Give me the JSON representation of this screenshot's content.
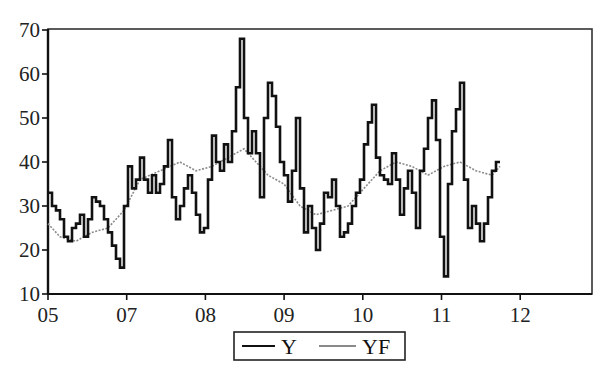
{
  "chart_data": {
    "type": "line",
    "title": "",
    "xlabel": "",
    "ylabel": "",
    "ylim": [
      10,
      70
    ],
    "yticks": [
      10,
      20,
      30,
      40,
      50,
      60,
      70
    ],
    "xticks": [
      "05",
      "07",
      "08",
      "09",
      "10",
      "11",
      "12"
    ],
    "grid": false,
    "legend_position": "bottom-center",
    "legend": [
      "Y",
      "YF"
    ],
    "series": [
      {
        "name": "Y",
        "color": "#111111",
        "style": "solid-thick",
        "x_px": [
          48,
          52,
          56,
          60,
          64,
          68,
          72,
          76,
          80,
          84,
          88,
          92,
          96,
          100,
          104,
          108,
          112,
          116,
          120,
          124,
          128,
          132,
          136,
          140,
          144,
          148,
          152,
          156,
          160,
          164,
          168,
          172,
          176,
          180,
          184,
          188,
          192,
          196,
          200,
          204,
          208,
          212,
          216,
          220,
          224,
          228,
          232,
          236,
          240,
          244,
          248,
          252,
          256,
          260,
          264,
          268,
          272,
          276,
          280,
          284,
          288,
          292,
          296,
          300,
          304,
          308,
          312,
          316,
          320,
          324,
          328,
          332,
          336,
          340,
          344,
          348,
          352,
          356,
          360,
          364,
          368,
          372,
          376,
          380,
          384,
          388,
          392,
          396,
          400,
          404,
          408,
          412,
          416,
          420,
          424,
          428,
          432,
          436,
          440,
          444,
          448,
          452,
          456,
          460,
          464,
          468,
          472,
          476,
          480,
          484,
          488,
          492,
          496,
          500
        ],
        "values": [
          33,
          30,
          29,
          27,
          23,
          22,
          25,
          26,
          28,
          23,
          27,
          32,
          31,
          30,
          27,
          24,
          21,
          18,
          16,
          30,
          39,
          34,
          36,
          41,
          36,
          33,
          37,
          33,
          35,
          39,
          45,
          32,
          27,
          30,
          34,
          37,
          33,
          28,
          24,
          25,
          36,
          46,
          40,
          38,
          44,
          40,
          47,
          57,
          68,
          50,
          42,
          47,
          42,
          32,
          50,
          58,
          55,
          48,
          40,
          37,
          31,
          38,
          50,
          34,
          24,
          30,
          25,
          20,
          26,
          33,
          32,
          36,
          30,
          23,
          24,
          26,
          30,
          33,
          36,
          44,
          49,
          53,
          41,
          37,
          36,
          35,
          42,
          36,
          28,
          34,
          38,
          33,
          25,
          38,
          43,
          50,
          54,
          45,
          23,
          14,
          35,
          47,
          52,
          58,
          36,
          25,
          30,
          26,
          22,
          26,
          32,
          38,
          40,
          40
        ]
      },
      {
        "name": "YF",
        "color": "#8a8a8a",
        "style": "dotted-thin",
        "x_px": [
          48,
          60,
          76,
          92,
          108,
          124,
          140,
          160,
          180,
          196,
          212,
          228,
          244,
          256,
          268,
          284,
          300,
          316,
          332,
          348,
          364,
          380,
          396,
          412,
          428,
          444,
          460,
          476,
          492,
          500
        ],
        "values": [
          26,
          23,
          22,
          24,
          25,
          29,
          36,
          38,
          40,
          38,
          39,
          41,
          43,
          40,
          37,
          35,
          30,
          28,
          29,
          30,
          34,
          38,
          40,
          39,
          37,
          39,
          40,
          38,
          37,
          39
        ]
      }
    ]
  },
  "axes": {
    "y_tick_labels": [
      "70",
      "60",
      "50",
      "40",
      "30",
      "20",
      "10"
    ],
    "x_tick_labels": [
      "05",
      "07",
      "08",
      "09",
      "10",
      "11",
      "12"
    ]
  },
  "legend": {
    "items": [
      {
        "label": "Y",
        "color": "#111111"
      },
      {
        "label": "YF",
        "color": "#8a8a8a"
      }
    ]
  }
}
